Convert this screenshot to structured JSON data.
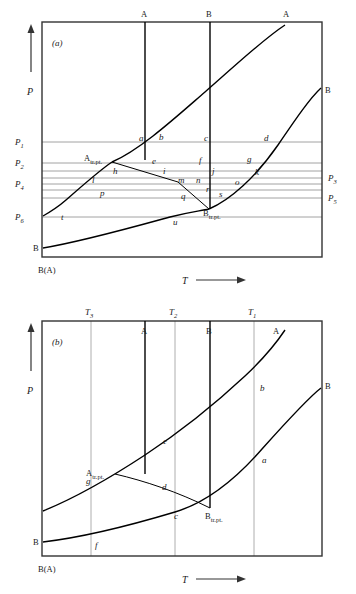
{
  "figure": {
    "type": "phase-diagram"
  },
  "panel_a": {
    "id": "(a)",
    "frame": {
      "x": 42,
      "y": 22,
      "w": 280,
      "h": 235
    },
    "y_axis_label": "P",
    "x_axis_label": "T",
    "origin_label": "B(A)",
    "top_labels": [
      {
        "text": "A",
        "x": 145
      },
      {
        "text": "B",
        "x": 210
      },
      {
        "text": "A",
        "x": 287
      }
    ],
    "edge_labels": [
      {
        "text": "B",
        "x": 327,
        "y": 90
      },
      {
        "text": "B",
        "x": 37,
        "y": 248
      }
    ],
    "pressure_levels_left": [
      {
        "label": "P",
        "sub": "1",
        "y": 142
      },
      {
        "label": "P",
        "sub": "2",
        "y": 163
      },
      {
        "label": "P",
        "sub": "4",
        "y": 183
      },
      {
        "label": "P",
        "sub": "6",
        "y": 217
      }
    ],
    "pressure_levels_right": [
      {
        "label": "P",
        "sub": "3",
        "y": 178
      },
      {
        "label": "P",
        "sub": "5",
        "y": 198
      }
    ],
    "gridlines_y": [
      142,
      163,
      171,
      178,
      183,
      190,
      198,
      217
    ],
    "transition_points": [
      {
        "main": "A",
        "sub": "tr.pt.",
        "x": 108,
        "y": 159
      },
      {
        "main": "B",
        "sub": "tr.pt.",
        "x": 207,
        "y": 210
      }
    ],
    "curve_labels": [
      {
        "text": "a",
        "x": 141,
        "y": 138
      },
      {
        "text": "b",
        "x": 160,
        "y": 137
      },
      {
        "text": "c",
        "x": 206,
        "y": 138
      },
      {
        "text": "d",
        "x": 266,
        "y": 138
      },
      {
        "text": "e",
        "x": 154,
        "y": 161
      },
      {
        "text": "f",
        "x": 200,
        "y": 160
      },
      {
        "text": "g",
        "x": 249,
        "y": 159
      },
      {
        "text": "h",
        "x": 135,
        "y": 170
      },
      {
        "text": "i",
        "x": 167,
        "y": 170
      },
      {
        "text": "j",
        "x": 212,
        "y": 171
      },
      {
        "text": "k",
        "x": 257,
        "y": 172
      },
      {
        "text": "l",
        "x": 113,
        "y": 180
      },
      {
        "text": "m",
        "x": 180,
        "y": 179
      },
      {
        "text": "n",
        "x": 196,
        "y": 179
      },
      {
        "text": "o",
        "x": 237,
        "y": 182
      },
      {
        "text": "p",
        "x": 122,
        "y": 193
      },
      {
        "text": "q",
        "x": 183,
        "y": 196
      },
      {
        "text": "r",
        "x": 207,
        "y": 189
      },
      {
        "text": "s",
        "x": 220,
        "y": 194
      },
      {
        "text": "t",
        "x": 63,
        "y": 216
      },
      {
        "text": "u",
        "x": 175,
        "y": 222
      }
    ]
  },
  "panel_b": {
    "id": "(b)",
    "frame": {
      "x": 42,
      "y": 321,
      "w": 280,
      "h": 235
    },
    "y_axis_label": "P",
    "x_axis_label": "T",
    "origin_label": "B(A)",
    "temperature_ticks": [
      {
        "label": "T",
        "sub": "3",
        "x": 91
      },
      {
        "label": "T",
        "sub": "2",
        "x": 175
      },
      {
        "label": "T",
        "sub": "1",
        "x": 254
      }
    ],
    "top_labels": [
      {
        "text": "A",
        "x": 145
      },
      {
        "text": "B",
        "x": 210
      },
      {
        "text": "A",
        "x": 277
      }
    ],
    "edge_labels": [
      {
        "text": "B",
        "x": 327,
        "y": 386
      },
      {
        "text": "B",
        "x": 37,
        "y": 542
      }
    ],
    "transition_points": [
      {
        "main": "A",
        "sub": "tr.pt.",
        "x": 110,
        "y": 474
      },
      {
        "main": "B",
        "sub": "tr.pt.",
        "x": 208,
        "y": 508
      }
    ],
    "curve_labels": [
      {
        "text": "a",
        "x": 264,
        "y": 460
      },
      {
        "text": "b",
        "x": 262,
        "y": 388
      },
      {
        "text": "c",
        "x": 176,
        "y": 515
      },
      {
        "text": "d",
        "x": 164,
        "y": 487
      },
      {
        "text": "e",
        "x": 165,
        "y": 441
      },
      {
        "text": "f",
        "x": 96,
        "y": 545
      },
      {
        "text": "g",
        "x": 88,
        "y": 481
      }
    ]
  },
  "colors": {
    "ink": "#1a1a1a",
    "curve": "#000000",
    "gridline": "#8c8c8c",
    "frame": "#333333"
  }
}
